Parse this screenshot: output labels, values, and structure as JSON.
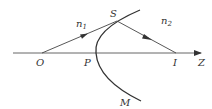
{
  "diagram": {
    "type": "refraction at spherical surface",
    "labels": {
      "n1": "n",
      "n1_sub": "1",
      "n2": "n",
      "n2_sub": "2",
      "S": "S",
      "O": "O",
      "P": "P",
      "I": "I",
      "Z": "Z",
      "M": "M"
    },
    "colors": {
      "line": "#333333",
      "axis": "#555555",
      "background": "#ffffff"
    }
  }
}
